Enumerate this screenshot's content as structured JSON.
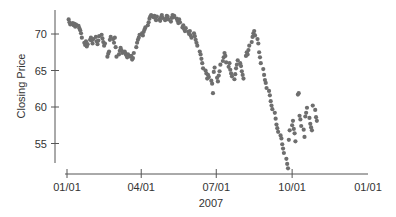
{
  "chart_data": {
    "type": "scatter",
    "title": "",
    "xlabel": "2007",
    "ylabel": "Closing Price",
    "x_ticks": [
      {
        "label": "01/01",
        "day": 0
      },
      {
        "label": "04/01",
        "day": 90
      },
      {
        "label": "07/01",
        "day": 181
      },
      {
        "label": "10/01",
        "day": 273
      },
      {
        "label": "01/01",
        "day": 365
      }
    ],
    "y_ticks": [
      55,
      60,
      65,
      70
    ],
    "ylim": [
      52,
      73.5
    ],
    "xlim": [
      0,
      365
    ],
    "grid": false,
    "point_color": "#6e6e6e",
    "series": [
      {
        "name": "Closing Price",
        "points": [
          [
            2,
            72.0
          ],
          [
            3,
            71.6
          ],
          [
            4,
            71.3
          ],
          [
            7,
            71.5
          ],
          [
            8,
            71.2
          ],
          [
            9,
            71.4
          ],
          [
            10,
            71.0
          ],
          [
            11,
            71.3
          ],
          [
            14,
            71.1
          ],
          [
            15,
            70.8
          ],
          [
            16,
            70.5
          ],
          [
            17,
            70.1
          ],
          [
            18,
            69.5
          ],
          [
            21,
            68.8
          ],
          [
            22,
            68.5
          ],
          [
            23,
            69.0
          ],
          [
            24,
            68.3
          ],
          [
            25,
            68.6
          ],
          [
            28,
            69.2
          ],
          [
            29,
            69.5
          ],
          [
            30,
            69.1
          ],
          [
            31,
            68.7
          ],
          [
            32,
            69.3
          ],
          [
            35,
            69.6
          ],
          [
            36,
            69.0
          ],
          [
            37,
            68.6
          ],
          [
            38,
            69.1
          ],
          [
            39,
            69.7
          ],
          [
            42,
            69.9
          ],
          [
            43,
            69.4
          ],
          [
            44,
            68.9
          ],
          [
            45,
            68.4
          ],
          [
            46,
            68.7
          ],
          [
            49,
            66.9
          ],
          [
            50,
            67.3
          ],
          [
            51,
            67.6
          ],
          [
            52,
            69.2
          ],
          [
            53,
            69.6
          ],
          [
            56,
            69.3
          ],
          [
            57,
            68.8
          ],
          [
            58,
            69.5
          ],
          [
            59,
            68.2
          ],
          [
            60,
            66.9
          ],
          [
            63,
            67.2
          ],
          [
            64,
            67.7
          ],
          [
            65,
            68.1
          ],
          [
            66,
            67.8
          ],
          [
            67,
            67.4
          ],
          [
            70,
            67.6
          ],
          [
            71,
            67.3
          ],
          [
            72,
            67.1
          ],
          [
            73,
            66.8
          ],
          [
            74,
            67.2
          ],
          [
            77,
            66.9
          ],
          [
            78,
            67.0
          ],
          [
            79,
            66.5
          ],
          [
            80,
            66.7
          ],
          [
            81,
            67.4
          ],
          [
            84,
            68.2
          ],
          [
            85,
            68.8
          ],
          [
            86,
            69.2
          ],
          [
            87,
            69.5
          ],
          [
            88,
            69.9
          ],
          [
            91,
            70.1
          ],
          [
            92,
            69.8
          ],
          [
            93,
            70.3
          ],
          [
            94,
            70.6
          ],
          [
            95,
            70.9
          ],
          [
            98,
            71.2
          ],
          [
            99,
            71.6
          ],
          [
            100,
            72.1
          ],
          [
            101,
            72.4
          ],
          [
            102,
            72.6
          ],
          [
            105,
            72.3
          ],
          [
            106,
            72.5
          ],
          [
            107,
            72.2
          ],
          [
            108,
            71.9
          ],
          [
            109,
            72.4
          ],
          [
            112,
            72.0
          ],
          [
            113,
            71.8
          ],
          [
            114,
            72.3
          ],
          [
            115,
            72.6
          ],
          [
            116,
            72.2
          ],
          [
            119,
            71.9
          ],
          [
            120,
            72.1
          ],
          [
            121,
            72.5
          ],
          [
            122,
            72.4
          ],
          [
            123,
            72.0
          ],
          [
            126,
            71.7
          ],
          [
            127,
            72.2
          ],
          [
            128,
            72.6
          ],
          [
            129,
            72.3
          ],
          [
            130,
            72.5
          ],
          [
            133,
            72.1
          ],
          [
            134,
            71.8
          ],
          [
            135,
            71.5
          ],
          [
            136,
            72.0
          ],
          [
            137,
            71.6
          ],
          [
            140,
            70.9
          ],
          [
            141,
            71.2
          ],
          [
            142,
            70.7
          ],
          [
            143,
            70.4
          ],
          [
            144,
            70.8
          ],
          [
            147,
            70.3
          ],
          [
            148,
            70.0
          ],
          [
            149,
            70.4
          ],
          [
            150,
            69.8
          ],
          [
            151,
            69.5
          ],
          [
            154,
            70.1
          ],
          [
            155,
            69.7
          ],
          [
            156,
            69.2
          ],
          [
            157,
            68.8
          ],
          [
            158,
            68.4
          ],
          [
            161,
            67.6
          ],
          [
            162,
            67.2
          ],
          [
            163,
            66.6
          ],
          [
            164,
            66.0
          ],
          [
            165,
            65.3
          ],
          [
            168,
            65.0
          ],
          [
            169,
            64.6
          ],
          [
            170,
            63.9
          ],
          [
            171,
            64.4
          ],
          [
            172,
            64.1
          ],
          [
            175,
            63.6
          ],
          [
            176,
            63.2
          ],
          [
            177,
            61.9
          ],
          [
            178,
            64.8
          ],
          [
            179,
            65.4
          ],
          [
            182,
            64.0
          ],
          [
            183,
            63.5
          ],
          [
            184,
            64.3
          ],
          [
            185,
            64.9
          ],
          [
            186,
            65.8
          ],
          [
            189,
            66.3
          ],
          [
            190,
            66.8
          ],
          [
            191,
            67.4
          ],
          [
            192,
            67.0
          ],
          [
            193,
            66.1
          ],
          [
            196,
            65.5
          ],
          [
            197,
            66.0
          ],
          [
            198,
            65.1
          ],
          [
            199,
            64.6
          ],
          [
            200,
            64.2
          ],
          [
            203,
            63.8
          ],
          [
            204,
            64.5
          ],
          [
            205,
            65.3
          ],
          [
            206,
            65.8
          ],
          [
            207,
            66.4
          ],
          [
            210,
            66.0
          ],
          [
            211,
            65.6
          ],
          [
            212,
            64.9
          ],
          [
            213,
            64.4
          ],
          [
            214,
            63.9
          ],
          [
            217,
            67.0
          ],
          [
            218,
            67.5
          ],
          [
            219,
            67.2
          ],
          [
            220,
            67.8
          ],
          [
            221,
            68.4
          ],
          [
            224,
            68.9
          ],
          [
            225,
            69.6
          ],
          [
            226,
            70.1
          ],
          [
            227,
            70.4
          ],
          [
            228,
            69.8
          ],
          [
            231,
            69.3
          ],
          [
            232,
            68.7
          ],
          [
            233,
            67.5
          ],
          [
            234,
            66.8
          ],
          [
            235,
            66.0
          ],
          [
            238,
            65.2
          ],
          [
            239,
            64.4
          ],
          [
            240,
            63.7
          ],
          [
            241,
            63.3
          ],
          [
            242,
            62.6
          ],
          [
            245,
            62.2
          ],
          [
            246,
            61.6
          ],
          [
            247,
            60.8
          ],
          [
            248,
            60.2
          ],
          [
            249,
            59.7
          ],
          [
            252,
            59.2
          ],
          [
            253,
            58.4
          ],
          [
            254,
            57.6
          ],
          [
            255,
            57.1
          ],
          [
            256,
            56.6
          ],
          [
            259,
            56.1
          ],
          [
            260,
            55.7
          ],
          [
            261,
            54.9
          ],
          [
            262,
            54.3
          ],
          [
            263,
            53.7
          ],
          [
            266,
            52.9
          ],
          [
            267,
            52.2
          ],
          [
            268,
            51.6
          ],
          [
            269,
            55.5
          ],
          [
            270,
            56.8
          ],
          [
            273,
            57.5
          ],
          [
            274,
            58.1
          ],
          [
            275,
            57.0
          ],
          [
            276,
            56.4
          ],
          [
            277,
            55.3
          ],
          [
            280,
            61.7
          ],
          [
            281,
            61.9
          ],
          [
            282,
            58.8
          ],
          [
            283,
            58.3
          ],
          [
            284,
            57.4
          ],
          [
            287,
            56.9
          ],
          [
            288,
            55.9
          ],
          [
            289,
            58.7
          ],
          [
            290,
            59.2
          ],
          [
            291,
            59.9
          ],
          [
            294,
            58.5
          ],
          [
            295,
            57.7
          ],
          [
            296,
            57.2
          ],
          [
            297,
            56.8
          ],
          [
            298,
            60.2
          ],
          [
            301,
            59.6
          ],
          [
            302,
            58.6
          ],
          [
            303,
            58.1
          ]
        ]
      }
    ]
  }
}
